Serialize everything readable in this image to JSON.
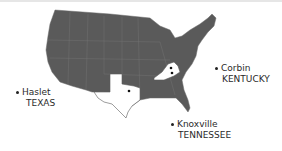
{
  "map": {
    "region": "United States",
    "land_color": "#5a5a5a",
    "highlight_color": "#ffffff",
    "highlighted_states": [
      "Texas",
      "Tennessee/Kentucky"
    ]
  },
  "locations": [
    {
      "city": "Haslet",
      "state": "TEXAS"
    },
    {
      "city": "Corbin",
      "state": "KENTUCKY"
    },
    {
      "city": "Knoxville",
      "state": "TENNESSEE"
    }
  ]
}
